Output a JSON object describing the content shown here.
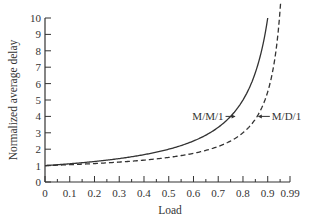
{
  "chart_data": {
    "type": "line",
    "title": "",
    "xlabel": "Load",
    "ylabel": "Normalized average delay",
    "xlim": [
      0,
      0.99
    ],
    "ylim": [
      0,
      10
    ],
    "x_ticks": [
      "0",
      "0.1",
      "0.2",
      "0.3",
      "0.4",
      "0.5",
      "0.6",
      "0.7",
      "0.8",
      "0.9",
      "0.99"
    ],
    "y_ticks": [
      "0",
      "1",
      "2",
      "3",
      "4",
      "5",
      "6",
      "7",
      "8",
      "9",
      "10"
    ],
    "grid": false,
    "legend": null,
    "series": [
      {
        "name": "M/M/1",
        "style": "solid",
        "x": [
          0,
          0.1,
          0.2,
          0.3,
          0.4,
          0.5,
          0.6,
          0.7,
          0.75,
          0.8,
          0.85,
          0.9
        ],
        "values": [
          1.0,
          1.11,
          1.25,
          1.43,
          1.67,
          2.0,
          2.5,
          3.33,
          4.0,
          5.0,
          6.67,
          10.0
        ]
      },
      {
        "name": "M/D/1",
        "style": "dashed",
        "x": [
          0,
          0.1,
          0.2,
          0.3,
          0.4,
          0.5,
          0.6,
          0.7,
          0.8,
          0.85,
          0.9,
          0.95
        ],
        "values": [
          1.0,
          1.06,
          1.13,
          1.21,
          1.33,
          1.5,
          1.75,
          2.17,
          3.0,
          3.83,
          5.5,
          10.5
        ]
      }
    ],
    "annotations": [
      {
        "text": "M/M/1",
        "points_to": "M/M/1",
        "at": [
          0.77,
          4.0
        ]
      },
      {
        "text": "M/D/1",
        "points_to": "M/D/1",
        "at": [
          0.86,
          4.0
        ]
      }
    ]
  }
}
